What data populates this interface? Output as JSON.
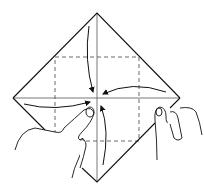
{
  "diagram": {
    "type": "origami-instruction",
    "colors": {
      "line": "#111111",
      "crease": "#555555",
      "background": "#ffffff"
    },
    "paper": {
      "top": [
        97,
        13
      ],
      "right": [
        180,
        98
      ],
      "bottom": [
        97,
        182
      ],
      "left": [
        13,
        98
      ]
    },
    "center": [
      97,
      98
    ],
    "dashed_square": {
      "x1": 55,
      "y1": 57,
      "x2": 139,
      "y2": 141
    },
    "arrows": [
      {
        "from": "top",
        "to": "center"
      },
      {
        "from": "right",
        "to": "center"
      },
      {
        "from": "left",
        "to": "center"
      },
      {
        "from": "bottom",
        "to": "center"
      }
    ],
    "hands": [
      "left-hand",
      "right-hand"
    ]
  }
}
